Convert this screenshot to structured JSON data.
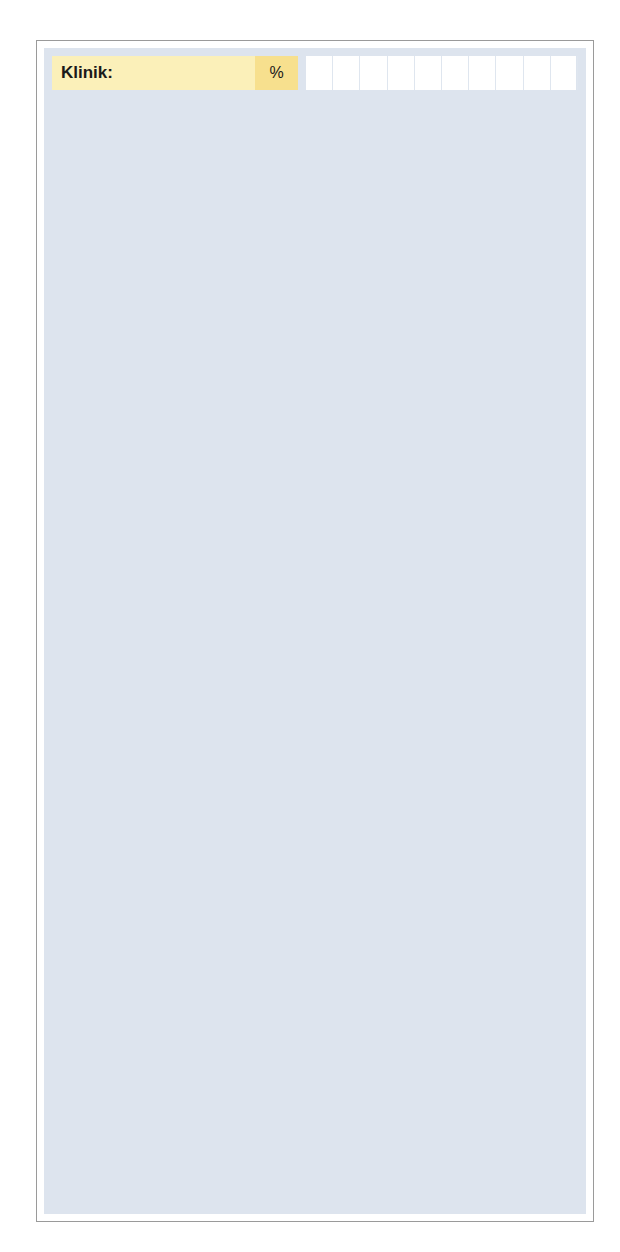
{
  "chart_data": {
    "type": "bar",
    "title": "",
    "xlabel": "",
    "ylabel": "",
    "xlim": [
      0,
      100
    ],
    "grid": true,
    "axis_ticks": [
      {
        "value": 50,
        "label": "50"
      },
      {
        "value": 100,
        "label": "100 %"
      }
    ],
    "unit_header": "%",
    "sections": [
      {
        "name": "Klinik:",
        "color": "#f6dd80",
        "items": [
          {
            "label_lines": [
              "Haut"
            ],
            "value": 100,
            "stacked": true
          },
          {
            "label_lines": [
              "Raynaud-",
              "Phänomen"
            ],
            "value": 90
          },
          {
            "label_lines": [
              "Schluck-",
              "störungen"
            ],
            "value": 58
          },
          {
            "label_lines": [
              "Lungenbefall"
            ],
            "value": 23
          },
          {
            "label_lines": [
              "Arthritis"
            ],
            "value": 12
          },
          {
            "label_lines": [
              "Myositis"
            ],
            "value": 10
          },
          {
            "label_lines": [
              "Herz"
            ],
            "value": 4
          },
          {
            "label_lines": [
              "Nieren"
            ],
            "value": 3
          },
          {
            "label_lines": [
              "Sjögren-",
              "Syndrom"
            ],
            "value": 7
          }
        ]
      },
      {
        "name": "Labor:",
        "color": "#c2d95e",
        "items": [
          {
            "label_lines": [
              "erhöhte Blut-",
              "senkung (> 25 mm)"
            ],
            "value": 47
          },
          {
            "label_lines": [
              "antinukleäre",
              "Antikörper"
            ],
            "value": 39
          },
          {
            "label_lines": [
              "Anämie",
              "(Hb < 12g/dl)"
            ],
            "value": 24
          },
          {
            "label_lines": [
              "vermehrte Gamma-",
              "globuline (> 2g/dl)"
            ],
            "value": 16
          },
          {
            "label_lines": [
              "Rheumafaktor",
              "positiv (> 1:80)"
            ],
            "value": 11
          },
          {
            "label_lines": [
              "Antiribonucleo-",
              "protein-Antikörper"
            ],
            "value": 8
          }
        ]
      }
    ],
    "stacked_bar": {
      "for_item": "Haut",
      "total": 100,
      "segments": [
        {
          "value": 22,
          "value_label": "22 %",
          "legend_lines": [
            "nur Sklero-",
            "daktylie"
          ],
          "color": "#fbeeb4"
        },
        {
          "value": 42,
          "value_label": "42 %",
          "legend_lines": [
            "+ Extremi-",
            "täten-",
            "befall"
          ],
          "color": "#f9e7a0"
        },
        {
          "value": 36,
          "value_label": "36 %",
          "legend_lines": [
            "+ Befall des",
            "Stammes"
          ],
          "color": "#f5d775"
        }
      ]
    }
  },
  "colors": {
    "clinic_bar": "#f6dd80",
    "lab_bar": "#c2d95e",
    "clinic_header": "#fbf0b9",
    "lab_header": "#dcea9f",
    "panel_background": "#dde4ee",
    "row_background": "#f2f6fa",
    "tick_marker": "#d2814a"
  }
}
